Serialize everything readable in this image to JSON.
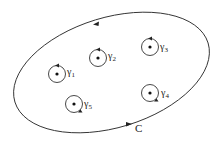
{
  "diagram": {
    "contour": {
      "label": "C",
      "color": "#333333"
    },
    "small_contours": [
      {
        "name": "γ",
        "sub": "1",
        "cx": 57,
        "cy": 74
      },
      {
        "name": "γ",
        "sub": "2",
        "cx": 98,
        "cy": 58
      },
      {
        "name": "γ",
        "sub": "3",
        "cx": 150,
        "cy": 47
      },
      {
        "name": "γ",
        "sub": "4",
        "cx": 150,
        "cy": 93
      },
      {
        "name": "γ",
        "sub": "5",
        "cx": 74,
        "cy": 104
      }
    ]
  }
}
